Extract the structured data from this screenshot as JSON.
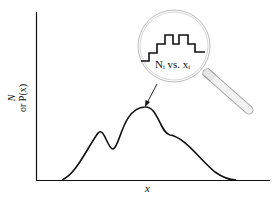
{
  "diagram": {
    "y_axis_label_line1": "N",
    "y_axis_label_line2": "or P(x)",
    "x_axis_label": "x",
    "magnifier_label": "N_i vs. x_i",
    "magnifier_label_display": "Nᵢ vs. xᵢ",
    "colors": {
      "line": "#111111",
      "lens_rim": "#bbbbbb",
      "handle": "#cccccc"
    }
  }
}
